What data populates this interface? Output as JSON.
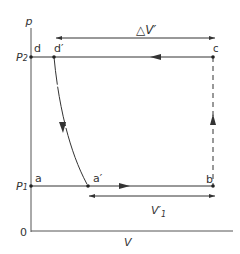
{
  "diagram": {
    "type": "p-V indicator diagram",
    "axes": {
      "y_label": "p",
      "x_label": "V",
      "origin_label": "0",
      "p2_label": "P",
      "p2_sub": "2",
      "p1_label": "P",
      "p1_sub": "1"
    },
    "points": {
      "a": "a",
      "a_prime": "a′",
      "b": "b",
      "c": "c",
      "d": "d",
      "d_prime": "d′"
    },
    "dimensions": {
      "delta_v_prime": "△V′",
      "v_prime_1": "V′",
      "v_prime_1_sub": "1"
    },
    "colors": {
      "line": "#333333",
      "background": "#ffffff"
    }
  }
}
